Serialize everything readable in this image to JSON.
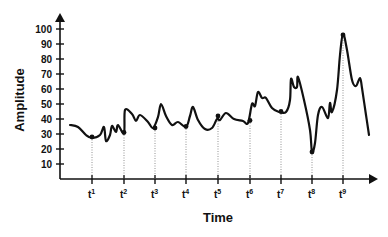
{
  "chart_data": {
    "type": "line",
    "title": "",
    "xlabel": "Time",
    "ylabel": "Amplitude",
    "ylim": [
      0,
      100
    ],
    "yticks": [
      10,
      20,
      30,
      40,
      50,
      60,
      70,
      80,
      90,
      100
    ],
    "xticks": [
      "t1",
      "t2",
      "t3",
      "t4",
      "t5",
      "t6",
      "t7",
      "t8",
      "t9"
    ],
    "grid": false,
    "legend": null,
    "marked_points": [
      {
        "label": "t1",
        "value": 28
      },
      {
        "label": "t2",
        "value": 31
      },
      {
        "label": "t3",
        "value": 34
      },
      {
        "label": "t4",
        "value": 35
      },
      {
        "label": "t5",
        "value": 42
      },
      {
        "label": "t6",
        "value": 39
      },
      {
        "label": "t7",
        "value": 45
      },
      {
        "label": "t8",
        "value": 18
      },
      {
        "label": "t9",
        "value": 96
      }
    ],
    "series": [
      {
        "name": "Amplitude",
        "points": [
          [
            70,
            125
          ],
          [
            78,
            127
          ],
          [
            86,
            135
          ],
          [
            92,
            138
          ],
          [
            100,
            135
          ],
          [
            104,
            127
          ],
          [
            106,
            141
          ],
          [
            110,
            135
          ],
          [
            112,
            126
          ],
          [
            116,
            132
          ],
          [
            118,
            125
          ],
          [
            124,
            133
          ],
          [
            125,
            110
          ],
          [
            132,
            114
          ],
          [
            136,
            121
          ],
          [
            140,
            115
          ],
          [
            148,
            122
          ],
          [
            153,
            128
          ],
          [
            158,
            117
          ],
          [
            161,
            104
          ],
          [
            166,
            116
          ],
          [
            172,
            125
          ],
          [
            178,
            122
          ],
          [
            186,
            127
          ],
          [
            190,
            116
          ],
          [
            193,
            107
          ],
          [
            198,
            120
          ],
          [
            205,
            129
          ],
          [
            212,
            128
          ],
          [
            217,
            119
          ],
          [
            220,
            120
          ],
          [
            226,
            113
          ],
          [
            234,
            119
          ],
          [
            243,
            121
          ],
          [
            248,
            123
          ],
          [
            252,
            104
          ],
          [
            255,
            106
          ],
          [
            258,
            92
          ],
          [
            262,
            98
          ],
          [
            266,
            98
          ],
          [
            272,
            108
          ],
          [
            279,
            112
          ],
          [
            286,
            112
          ],
          [
            290,
            100
          ],
          [
            291,
            79
          ],
          [
            294,
            87
          ],
          [
            297,
            87
          ],
          [
            298,
            77
          ],
          [
            304,
            100
          ],
          [
            310,
            130
          ],
          [
            312,
            152
          ],
          [
            315,
            143
          ],
          [
            318,
            115
          ],
          [
            322,
            107
          ],
          [
            328,
            118
          ],
          [
            330,
            103
          ],
          [
            332,
            112
          ],
          [
            337,
            90
          ],
          [
            340,
            55
          ],
          [
            343,
            34
          ],
          [
            347,
            50
          ],
          [
            352,
            80
          ],
          [
            356,
            86
          ],
          [
            360,
            78
          ],
          [
            362,
            88
          ],
          [
            366,
            115
          ],
          [
            369,
            135
          ]
        ]
      }
    ]
  },
  "axes": {
    "origin": [
      60,
      179
    ],
    "y_top": 13,
    "x_right": 378,
    "y_px_per_unit": 1.5,
    "t_positions": [
      92,
      124,
      155,
      186,
      218,
      250,
      281,
      312,
      343
    ]
  },
  "labels": {
    "xlabel": "Time",
    "ylabel": "Amplitude",
    "t_base": "t",
    "t_sups": [
      "1",
      "2",
      "3",
      "4",
      "5",
      "6",
      "7",
      "8",
      "9"
    ],
    "y_ticks": [
      "10",
      "20",
      "30",
      "40",
      "50",
      "60",
      "70",
      "80",
      "90",
      "100"
    ]
  },
  "colors": {
    "line": "#111111",
    "axis": "#111111",
    "guide": "#777777",
    "background": "#ffffff"
  }
}
